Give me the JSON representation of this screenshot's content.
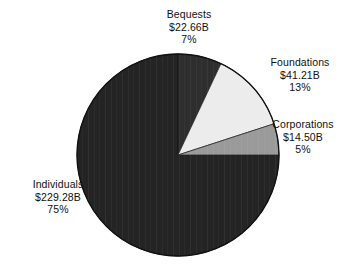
{
  "chart_data": {
    "type": "pie",
    "title": "",
    "subtitle": "",
    "xlabel": "",
    "ylabel": "",
    "legend_position": "none",
    "grid": false,
    "value_unit": "billions of USD",
    "total_value": "$307.65B",
    "categories": [
      "Bequests",
      "Foundations",
      "Corporations",
      "Individuals"
    ],
    "values": [
      22.66,
      41.21,
      14.5,
      229.28
    ],
    "percentages": [
      7,
      13,
      5,
      75
    ],
    "start_angle_deg": 0,
    "direction": "clockwise",
    "slices": [
      {
        "label": "Bequests",
        "value": 22.66,
        "value_label": "$22.66B",
        "percent": 7,
        "percent_label": "7%",
        "color": "#2e2e2e",
        "start_deg": 0,
        "end_deg": 25.2
      },
      {
        "label": "Foundations",
        "value": 41.21,
        "value_label": "$41.21B",
        "percent": 13,
        "percent_label": "13%",
        "color": "#ececec",
        "start_deg": 25.2,
        "end_deg": 72.0
      },
      {
        "label": "Corporations",
        "value": 14.5,
        "value_label": "$14.50B",
        "percent": 5,
        "percent_label": "5%",
        "color": "#9a9a9a",
        "start_deg": 72.0,
        "end_deg": 90.0
      },
      {
        "label": "Individuals",
        "value": 229.28,
        "value_label": "$229.28B",
        "percent": 75,
        "percent_label": "75%",
        "color": "#242424",
        "start_deg": 90.0,
        "end_deg": 360.0
      }
    ],
    "geometry": {
      "center_x": 178,
      "center_y": 155,
      "radius": 101,
      "outline_color": "#111111"
    },
    "background_color": "#ffffff",
    "text_color": "#101010"
  }
}
